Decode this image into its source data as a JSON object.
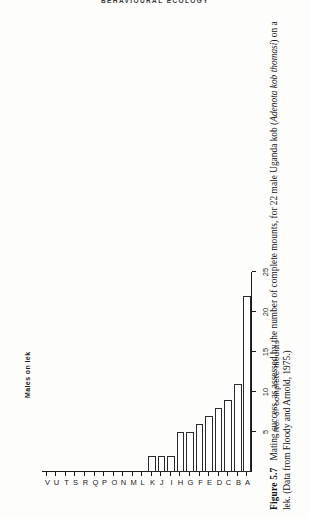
{
  "running_header": "BEHAVIOURAL ECOLOGY",
  "figure": {
    "label": "Figure 5.7",
    "caption_part1": "Mating success, as assessed by the number of complete mounts, for 22 male Uganda kob (",
    "species": "Adenota kob thomasi",
    "caption_part2": ") on a lek. (Data from Floody and Arnold, 1975.)"
  },
  "chart_data": {
    "type": "bar",
    "orientation": "horizontal",
    "title": "",
    "xlabel": "No. of complete mounts",
    "ylabel": "Males on lek",
    "categories": [
      "A",
      "B",
      "C",
      "D",
      "E",
      "F",
      "G",
      "H",
      "I",
      "J",
      "K",
      "L",
      "M",
      "N",
      "O",
      "P",
      "Q",
      "R",
      "S",
      "T",
      "U",
      "V"
    ],
    "values": [
      22,
      11,
      9,
      8,
      7,
      6,
      5,
      5,
      2,
      2,
      2,
      0,
      0,
      0,
      0,
      0,
      0,
      0,
      0,
      0,
      0,
      0
    ],
    "xlim": [
      0,
      25
    ],
    "xticks": [
      5,
      10,
      15,
      20,
      25
    ],
    "xticklabels": [
      "5",
      "10",
      "15",
      "20",
      "25"
    ],
    "grid": false,
    "legend": null,
    "bar_fill": "#ffffff",
    "bar_edge": "#2a2a2a",
    "axis_color": "#1a1a1a"
  },
  "axis": {
    "value_axis_title": "No. of complete mounts",
    "category_axis_title": "Males on lek"
  }
}
